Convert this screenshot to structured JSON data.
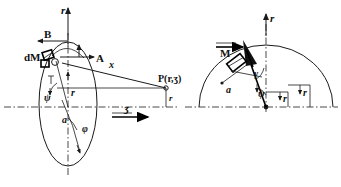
{
  "figure": {
    "width": 341,
    "height": 187,
    "background_color": "#ffffff",
    "line_color": "#1a1a1a"
  },
  "left_diagram": {
    "name": "meridian-ellipse-diagram",
    "axis_vertical_label": "r",
    "axis_horizontal_label": "ʒ",
    "mass_element_label": "dM",
    "component_a_label": "A",
    "component_b_label": "B",
    "distance_label": "x",
    "radius_label": "r",
    "angle_psi_label": "ψ",
    "angle_phi_label": "φ",
    "semi_axis_label": "a",
    "point_label": "P(r,ʒ)",
    "point_radius_label": "r"
  },
  "right_diagram": {
    "name": "polar-construction-diagram",
    "axis_vertical_label": "r",
    "moment_label": "M",
    "angle_gamma_label": "γ",
    "angle_psi_label": "ψ",
    "semi_axis_label": "a",
    "radius_inner_label": "r",
    "radius_outer_label": "r"
  }
}
